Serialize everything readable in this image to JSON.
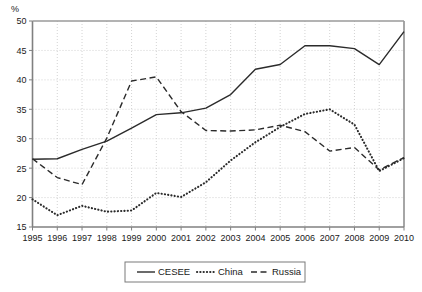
{
  "chart_data": {
    "type": "line",
    "title": "",
    "subtitle": "",
    "xlabel": "",
    "ylabel": "",
    "unit_label": "%",
    "grid": true,
    "legend_position": "bottom",
    "xlim": [
      1995,
      2010
    ],
    "ylim": [
      15,
      50
    ],
    "ytick_step": 5,
    "yticks": [
      15,
      20,
      25,
      30,
      35,
      40,
      45,
      50
    ],
    "ytick_labels": [
      "15",
      "20",
      "25",
      "30",
      "35",
      "40",
      "45",
      "50"
    ],
    "x": [
      1995,
      1996,
      1997,
      1998,
      1999,
      2000,
      2001,
      2002,
      2003,
      2004,
      2005,
      2006,
      2007,
      2008,
      2009,
      2010
    ],
    "xtick_labels": [
      "1995",
      "1996",
      "1997",
      "1998",
      "1999",
      "2000",
      "2001",
      "2002",
      "2003",
      "2004",
      "2005",
      "2006",
      "2007",
      "2008",
      "2009",
      "2010"
    ],
    "series": [
      {
        "name": "CESEE",
        "style": "solid",
        "color": "#2b2b2b",
        "values": [
          26.5,
          26.6,
          28.2,
          29.6,
          31.8,
          34.1,
          34.4,
          35.2,
          37.5,
          41.8,
          42.6,
          45.8,
          45.8,
          45.3,
          42.6,
          48.2
        ]
      },
      {
        "name": "China",
        "style": "dotted",
        "color": "#2b2b2b",
        "values": [
          19.7,
          17.0,
          18.6,
          17.6,
          17.8,
          20.8,
          20.1,
          22.6,
          26.3,
          29.4,
          32.0,
          34.2,
          35.0,
          32.4,
          24.5,
          26.7
        ]
      },
      {
        "name": "Russia",
        "style": "dashed",
        "color": "#2b2b2b",
        "values": [
          26.6,
          23.4,
          22.2,
          30.1,
          39.8,
          40.5,
          34.6,
          31.4,
          31.3,
          31.5,
          32.3,
          31.2,
          27.9,
          28.5,
          24.7,
          26.8
        ]
      }
    ],
    "legend": [
      {
        "label": "CESEE",
        "style": "solid"
      },
      {
        "label": "China",
        "style": "dotted"
      },
      {
        "label": "Russia",
        "style": "dashed"
      }
    ]
  },
  "colors": {
    "line": "#2b2b2b",
    "grid": "#c8c8c8",
    "axis": "#808080",
    "text": "#1a1a1a",
    "background": "#ffffff"
  }
}
